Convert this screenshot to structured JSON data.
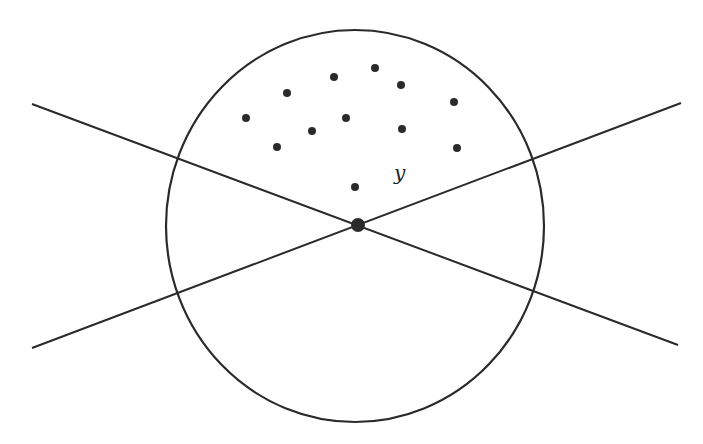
{
  "diagram": {
    "colors": {
      "stroke": "#2a2a2a",
      "dot": "#2b2b2b",
      "background": "#ffffff"
    },
    "circle": {
      "cx": 355,
      "cy": 226,
      "rx": 189,
      "ry": 196
    },
    "lines": [
      {
        "name": "line-descending",
        "x1": 32,
        "y1": 104,
        "x2": 678,
        "y2": 345
      },
      {
        "name": "line-ascending",
        "x1": 32,
        "y1": 348,
        "x2": 681,
        "y2": 103
      }
    ],
    "center_point": {
      "x": 358,
      "y": 225,
      "r": 7
    },
    "points": [
      {
        "x": 246,
        "y": 118
      },
      {
        "x": 287,
        "y": 93
      },
      {
        "x": 334,
        "y": 77
      },
      {
        "x": 375,
        "y": 68
      },
      {
        "x": 401,
        "y": 85
      },
      {
        "x": 454,
        "y": 102
      },
      {
        "x": 346,
        "y": 118
      },
      {
        "x": 312,
        "y": 131
      },
      {
        "x": 402,
        "y": 129
      },
      {
        "x": 277,
        "y": 147
      },
      {
        "x": 457,
        "y": 148
      },
      {
        "x": 355,
        "y": 187
      }
    ],
    "point_radius": 4,
    "label": {
      "text": "y",
      "x": 394,
      "y": 180
    }
  }
}
